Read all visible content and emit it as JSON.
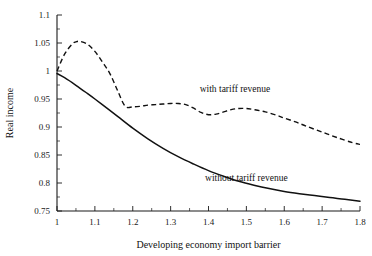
{
  "chart_data": {
    "type": "line",
    "title": "",
    "xlabel": "Developing economy import barrier",
    "ylabel": "Real income",
    "xlim": [
      1.0,
      1.8
    ],
    "ylim": [
      0.75,
      1.1
    ],
    "grid": false,
    "legend_position": "inline-annotations",
    "xticks": [
      "1",
      "1.1",
      "1.2",
      "1.3",
      "1.4",
      "1.5",
      "1.6",
      "1.7",
      "1.8"
    ],
    "xtick_values": [
      1.0,
      1.1,
      1.2,
      1.3,
      1.4,
      1.5,
      1.6,
      1.7,
      1.8
    ],
    "xtick_minor_step": 0.05,
    "yticks": [
      "0.75",
      "0.8",
      "0.85",
      "0.9",
      "0.95",
      "1",
      "1.05",
      "1.1"
    ],
    "ytick_values": [
      0.75,
      0.8,
      0.85,
      0.9,
      0.95,
      1.0,
      1.05,
      1.1
    ],
    "ytick_minor_step": 0.025,
    "series": [
      {
        "name": "with tariff revenue",
        "style": "dashed",
        "label_x": 1.47,
        "label_y": 0.962,
        "x": [
          1.0,
          1.02,
          1.04,
          1.05,
          1.06,
          1.08,
          1.1,
          1.12,
          1.14,
          1.16,
          1.18,
          1.2,
          1.22,
          1.24,
          1.26,
          1.28,
          1.3,
          1.32,
          1.34,
          1.36,
          1.38,
          1.4,
          1.42,
          1.44,
          1.46,
          1.48,
          1.5,
          1.52,
          1.55,
          1.58,
          1.6,
          1.63,
          1.66,
          1.7,
          1.74,
          1.78,
          1.8
        ],
        "values": [
          1.0,
          1.03,
          1.048,
          1.052,
          1.053,
          1.048,
          1.035,
          1.016,
          0.995,
          0.965,
          0.937,
          0.936,
          0.937,
          0.939,
          0.94,
          0.941,
          0.942,
          0.942,
          0.94,
          0.934,
          0.926,
          0.922,
          0.923,
          0.927,
          0.931,
          0.933,
          0.933,
          0.931,
          0.927,
          0.921,
          0.916,
          0.909,
          0.901,
          0.891,
          0.881,
          0.872,
          0.869
        ]
      },
      {
        "name": "without tariff revenue",
        "style": "solid",
        "label_x": 1.5,
        "label_y": 0.803,
        "x": [
          1.0,
          1.02,
          1.05,
          1.08,
          1.1,
          1.13,
          1.16,
          1.2,
          1.24,
          1.28,
          1.32,
          1.36,
          1.4,
          1.44,
          1.48,
          1.52,
          1.56,
          1.6,
          1.64,
          1.68,
          1.72,
          1.76,
          1.8
        ],
        "values": [
          0.9955,
          0.988,
          0.9745,
          0.96,
          0.95,
          0.9345,
          0.919,
          0.898,
          0.879,
          0.862,
          0.847,
          0.834,
          0.822,
          0.812,
          0.803,
          0.796,
          0.79,
          0.785,
          0.781,
          0.7775,
          0.774,
          0.771,
          0.7675
        ]
      }
    ]
  },
  "colors": {
    "background": "#ffffff",
    "axis": "#1a1a1a",
    "curve": "#111111"
  }
}
